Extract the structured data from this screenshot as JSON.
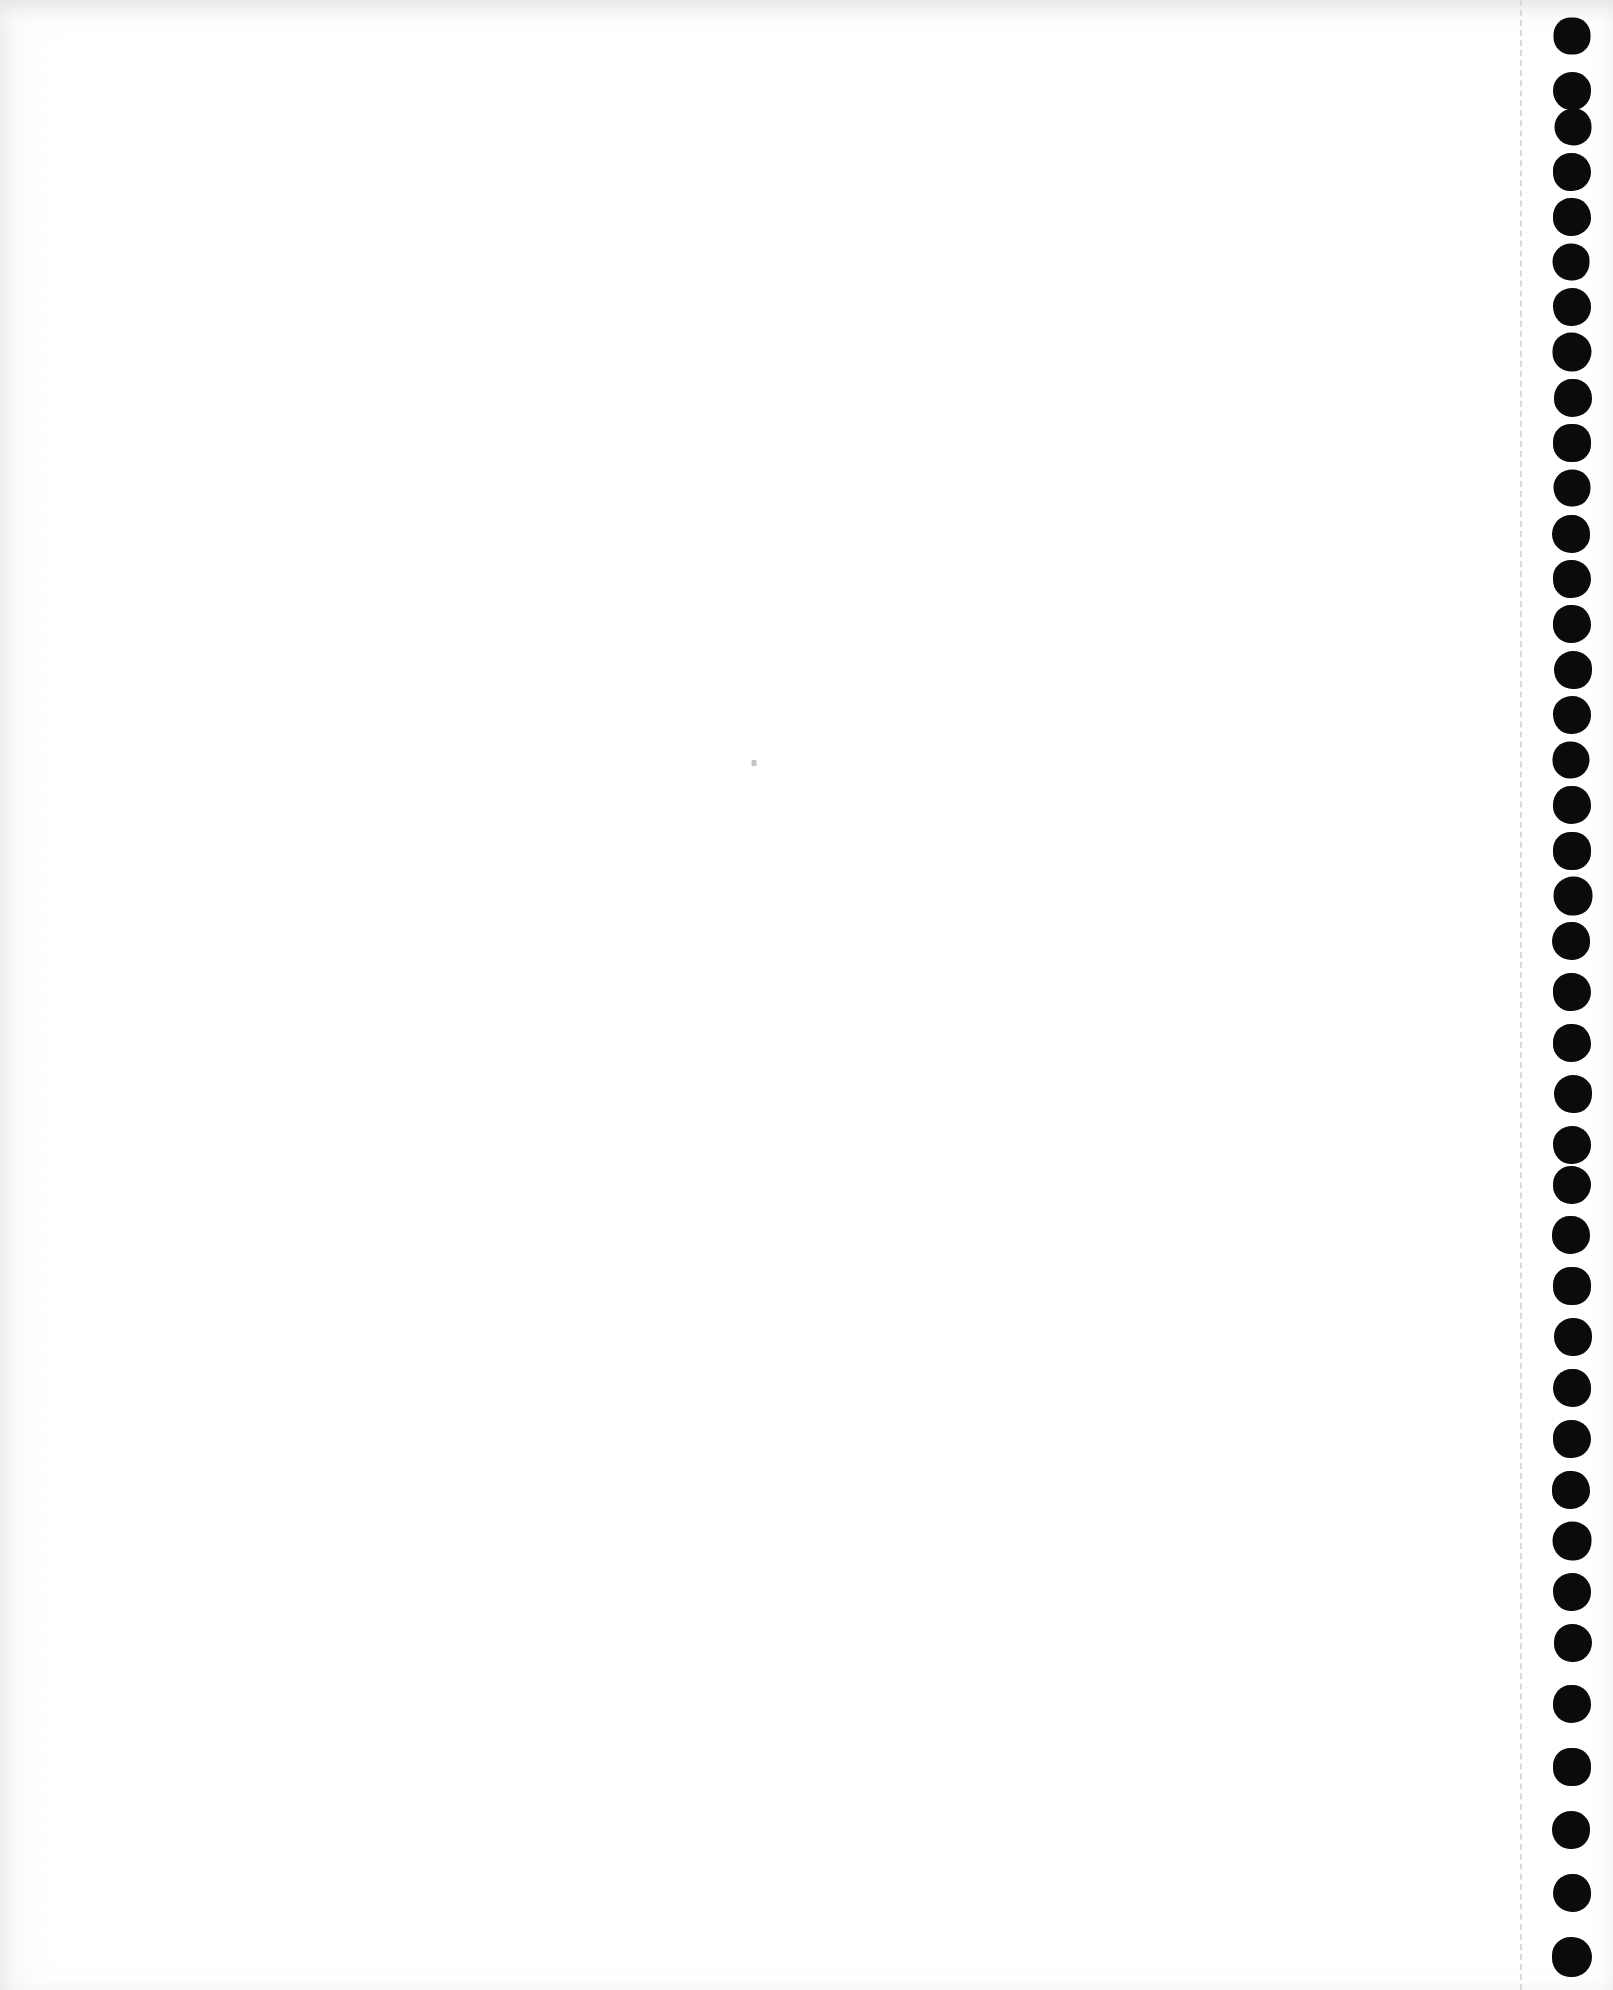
{
  "document": {
    "title": "Scanned blank page",
    "description": "Blank white scanned sheet of continuous tractor-feed computer paper",
    "width": 1613,
    "height": 1990,
    "page_color": "#ffffff",
    "content_text": "",
    "body_text_lines": []
  },
  "paper": {
    "background_color": "#ffffff",
    "edge_shadow_color": "#e8e9eb",
    "grain_opacity": 0.5
  },
  "perforation": {
    "name": "tear-off perforation strip",
    "line_x": 1520,
    "line_color": "#d9dadc",
    "dash_length": 11,
    "gap_length": 10,
    "line_width": 2,
    "style": "dashed"
  },
  "sprockets": {
    "name": "tractor feed sprocket holes",
    "color": "#0b0b0b",
    "center_x": 1572,
    "first_center_y": 36,
    "spacing": 55,
    "count": 36,
    "diameter": 38,
    "holes": [
      {
        "cy": 36,
        "d": 37,
        "dx": 0
      },
      {
        "cy": 91,
        "d": 38,
        "dx": 0
      },
      {
        "cy": 127,
        "d": 37,
        "dx": 1
      },
      {
        "cy": 172,
        "d": 38,
        "dx": 0
      },
      {
        "cy": 217,
        "d": 38,
        "dx": 0
      },
      {
        "cy": 262,
        "d": 37,
        "dx": -1
      },
      {
        "cy": 307,
        "d": 38,
        "dx": 0
      },
      {
        "cy": 352,
        "d": 39,
        "dx": 0
      },
      {
        "cy": 398,
        "d": 38,
        "dx": 1
      },
      {
        "cy": 443,
        "d": 38,
        "dx": 0
      },
      {
        "cy": 488,
        "d": 37,
        "dx": 0
      },
      {
        "cy": 534,
        "d": 38,
        "dx": -1
      },
      {
        "cy": 579,
        "d": 38,
        "dx": 0
      },
      {
        "cy": 624,
        "d": 38,
        "dx": 0
      },
      {
        "cy": 670,
        "d": 38,
        "dx": 1
      },
      {
        "cy": 715,
        "d": 38,
        "dx": 0
      },
      {
        "cy": 760,
        "d": 37,
        "dx": -1
      },
      {
        "cy": 805,
        "d": 38,
        "dx": 0
      },
      {
        "cy": 851,
        "d": 38,
        "dx": 0
      },
      {
        "cy": 896,
        "d": 39,
        "dx": 1
      },
      {
        "cy": 941,
        "d": 38,
        "dx": -1
      },
      {
        "cy": 992,
        "d": 38,
        "dx": 0
      },
      {
        "cy": 1043,
        "d": 38,
        "dx": 0
      },
      {
        "cy": 1094,
        "d": 38,
        "dx": 1
      },
      {
        "cy": 1145,
        "d": 38,
        "dx": 0
      },
      {
        "cy": 1185,
        "d": 38,
        "dx": 0
      },
      {
        "cy": 1235,
        "d": 38,
        "dx": -1
      },
      {
        "cy": 1286,
        "d": 38,
        "dx": 0
      },
      {
        "cy": 1337,
        "d": 38,
        "dx": 1
      },
      {
        "cy": 1388,
        "d": 38,
        "dx": 0
      },
      {
        "cy": 1439,
        "d": 38,
        "dx": 0
      },
      {
        "cy": 1490,
        "d": 38,
        "dx": -1
      },
      {
        "cy": 1541,
        "d": 39,
        "dx": 0
      },
      {
        "cy": 1592,
        "d": 38,
        "dx": 0
      },
      {
        "cy": 1643,
        "d": 38,
        "dx": 1
      },
      {
        "cy": 1704,
        "d": 38,
        "dx": 0
      },
      {
        "cy": 1767,
        "d": 38,
        "dx": 0
      },
      {
        "cy": 1830,
        "d": 38,
        "dx": -1
      },
      {
        "cy": 1893,
        "d": 38,
        "dx": 0
      },
      {
        "cy": 1957,
        "d": 40,
        "dx": 0
      }
    ]
  },
  "artifacts": {
    "specks": [
      {
        "name": "scan-speck",
        "x": 754,
        "y": 763,
        "w": 5,
        "h": 6
      }
    ]
  }
}
